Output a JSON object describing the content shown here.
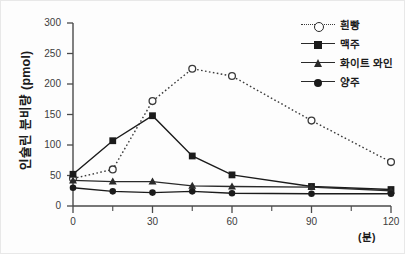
{
  "chart_data": {
    "type": "line",
    "title": "",
    "xlabel": "(분)",
    "ylabel": "인슐린 분비량 (pmol)",
    "x": [
      0,
      15,
      30,
      45,
      60,
      90,
      120
    ],
    "xlim": [
      0,
      120
    ],
    "ylim": [
      0,
      300
    ],
    "xticks": [
      0,
      30,
      60,
      90,
      120
    ],
    "xtick_labels": [
      "0",
      "30",
      "60",
      "90",
      "120"
    ],
    "xminor_ticks": [
      15,
      45,
      75,
      105
    ],
    "yticks": [
      0,
      50,
      100,
      150,
      200,
      250,
      300
    ],
    "ytick_labels": [
      "0",
      "50",
      "100",
      "150",
      "200",
      "250",
      "300"
    ],
    "grid": false,
    "legend_position": "top-right",
    "series": [
      {
        "name": "흰빵",
        "marker": "circle-open",
        "line_style": "dotted",
        "color": "#3a3a3a",
        "values": [
          45,
          60,
          172,
          225,
          213,
          140,
          72
        ]
      },
      {
        "name": "맥주",
        "marker": "square-filled",
        "line_style": "solid",
        "color": "#1b1b1b",
        "values": [
          52,
          107,
          148,
          82,
          51,
          32,
          27
        ]
      },
      {
        "name": "화이트 와인",
        "marker": "triangle-filled",
        "line_style": "solid",
        "color": "#2a2a2a",
        "values": [
          42,
          40,
          40,
          33,
          32,
          31,
          25
        ]
      },
      {
        "name": "양주",
        "marker": "circle-filled",
        "line_style": "solid",
        "color": "#1b1b1b",
        "values": [
          30,
          24,
          22,
          24,
          21,
          20,
          20
        ]
      }
    ]
  }
}
